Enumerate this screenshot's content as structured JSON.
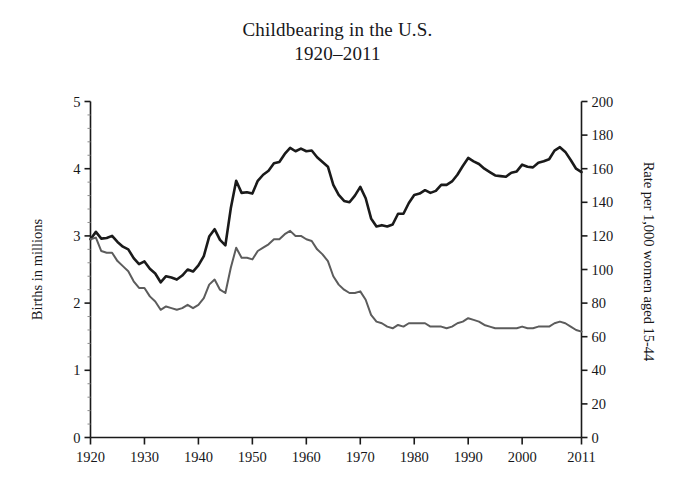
{
  "chart_data": {
    "type": "line",
    "title": "Childbearing in the U.S.",
    "subtitle": "1920–2011",
    "xlabel": "",
    "ylabel": "Births in millions",
    "y2label": "Rate per 1,000 women aged 15-44",
    "xlim": [
      1920,
      2011
    ],
    "ylim": [
      0,
      5
    ],
    "y2lim": [
      0,
      200
    ],
    "grid": false,
    "legend": "none",
    "xticks": [
      1920,
      1930,
      1940,
      1950,
      1960,
      1970,
      1980,
      1990,
      2000,
      2011
    ],
    "xticklabels": [
      "1920",
      "1930",
      "1940",
      "1950",
      "1960",
      "1970",
      "1980",
      "1990",
      "2000",
      "2011"
    ],
    "yticks": [
      0,
      1,
      2,
      3,
      4,
      5
    ],
    "yticklabels": [
      "0",
      "1",
      "2",
      "3",
      "4",
      "5"
    ],
    "y2ticks": [
      0,
      20,
      40,
      60,
      80,
      100,
      120,
      140,
      160,
      180,
      200
    ],
    "y2ticklabels": [
      "0",
      "20",
      "40",
      "60",
      "80",
      "100",
      "120",
      "140",
      "160",
      "180",
      "200"
    ],
    "colors": {
      "births_line": "#1a1a1a",
      "rate_line": "#5c5c5c",
      "axis": "#1a1a1a",
      "background": "#ffffff"
    },
    "x": [
      1920,
      1921,
      1922,
      1923,
      1924,
      1925,
      1926,
      1927,
      1928,
      1929,
      1930,
      1931,
      1932,
      1933,
      1934,
      1935,
      1936,
      1937,
      1938,
      1939,
      1940,
      1941,
      1942,
      1943,
      1944,
      1945,
      1946,
      1947,
      1948,
      1949,
      1950,
      1951,
      1952,
      1953,
      1954,
      1955,
      1956,
      1957,
      1958,
      1959,
      1960,
      1961,
      1962,
      1963,
      1964,
      1965,
      1966,
      1967,
      1968,
      1969,
      1970,
      1971,
      1972,
      1973,
      1974,
      1975,
      1976,
      1977,
      1978,
      1979,
      1980,
      1981,
      1982,
      1983,
      1984,
      1985,
      1986,
      1987,
      1988,
      1989,
      1990,
      1991,
      1992,
      1993,
      1994,
      1995,
      1996,
      1997,
      1998,
      1999,
      2000,
      2001,
      2002,
      2003,
      2004,
      2005,
      2006,
      2007,
      2008,
      2009,
      2010,
      2011
    ],
    "series": [
      {
        "name": "Births in millions",
        "axis": "left",
        "units": "millions",
        "values": [
          2.95,
          3.06,
          2.96,
          2.97,
          3.0,
          2.91,
          2.84,
          2.8,
          2.67,
          2.58,
          2.62,
          2.51,
          2.44,
          2.31,
          2.4,
          2.38,
          2.35,
          2.41,
          2.5,
          2.47,
          2.56,
          2.7,
          2.99,
          3.1,
          2.94,
          2.86,
          3.41,
          3.82,
          3.64,
          3.65,
          3.63,
          3.82,
          3.91,
          3.97,
          4.08,
          4.1,
          4.22,
          4.31,
          4.26,
          4.3,
          4.26,
          4.27,
          4.17,
          4.1,
          4.03,
          3.76,
          3.61,
          3.52,
          3.5,
          3.6,
          3.73,
          3.56,
          3.26,
          3.14,
          3.16,
          3.14,
          3.17,
          3.33,
          3.33,
          3.49,
          3.61,
          3.63,
          3.68,
          3.64,
          3.67,
          3.76,
          3.76,
          3.81,
          3.91,
          4.04,
          4.16,
          4.11,
          4.07,
          4.0,
          3.95,
          3.9,
          3.89,
          3.88,
          3.94,
          3.96,
          4.06,
          4.03,
          4.02,
          4.09,
          4.11,
          4.14,
          4.27,
          4.32,
          4.25,
          4.13,
          4.0,
          3.95
        ]
      },
      {
        "name": "Rate per 1,000 women aged 15-44",
        "axis": "right",
        "units": "births per 1,000 women aged 15-44",
        "values": [
          118,
          119,
          111,
          110,
          110,
          105,
          102,
          99,
          93,
          89,
          89,
          84,
          81,
          76,
          78,
          77,
          76,
          77,
          79,
          77,
          79,
          83,
          91,
          94,
          88,
          86,
          101,
          113,
          107,
          107,
          106,
          111,
          113,
          115,
          118,
          118,
          121,
          123,
          120,
          120,
          118,
          117,
          112,
          109,
          105,
          96,
          91,
          88,
          86,
          86,
          87,
          82,
          73,
          69,
          68,
          66,
          65,
          67,
          66,
          68,
          68,
          68,
          68,
          66,
          66,
          66,
          65,
          66,
          68,
          69,
          71,
          70,
          69,
          67,
          66,
          65,
          65,
          65,
          65,
          65,
          66,
          65,
          65,
          66,
          66,
          66,
          68,
          69,
          68,
          66,
          64,
          63
        ]
      }
    ]
  },
  "axes": {
    "left_title": "Births in millions",
    "right_title": "Rate per 1,000 women aged 15-44"
  }
}
